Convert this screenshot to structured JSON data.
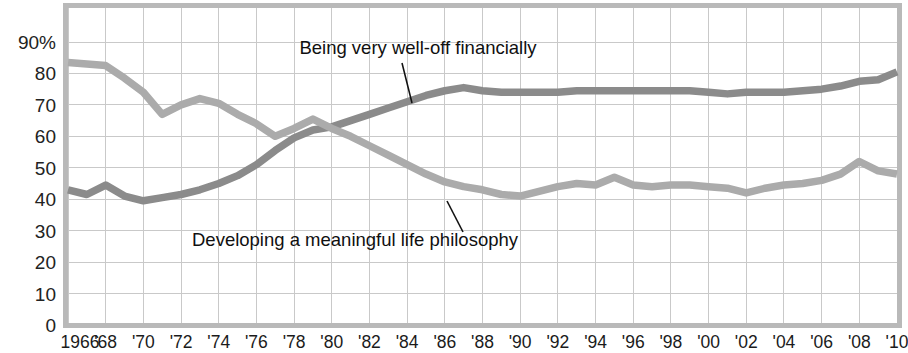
{
  "chart_data": {
    "type": "line",
    "title": "",
    "subtitle": "",
    "xlabel": "",
    "ylabel": "",
    "xlim": [
      1966,
      2010
    ],
    "ylim": [
      0,
      95
    ],
    "grid": true,
    "legend_position": "inline-annotations",
    "x": [
      1966,
      1967,
      1968,
      1969,
      1970,
      1971,
      1972,
      1973,
      1974,
      1975,
      1976,
      1977,
      1978,
      1979,
      1980,
      1981,
      1982,
      1983,
      1984,
      1985,
      1986,
      1987,
      1988,
      1989,
      1990,
      1991,
      1992,
      1993,
      1994,
      1995,
      1996,
      1997,
      1998,
      1999,
      2000,
      2001,
      2002,
      2003,
      2004,
      2005,
      2006,
      2007,
      2008,
      2009,
      2010
    ],
    "tick_labels": [
      "1966",
      "'68",
      "'70",
      "'72",
      "'74",
      "'76",
      "'78",
      "'80",
      "'82",
      "'84",
      "'86",
      "'88",
      "'90",
      "'92",
      "'94",
      "'96",
      "'98",
      "'00",
      "'02",
      "'04",
      "'06",
      "'08",
      "'10"
    ],
    "tick_years": [
      1966,
      1968,
      1970,
      1972,
      1974,
      1976,
      1978,
      1980,
      1982,
      1984,
      1986,
      1988,
      1990,
      1992,
      1994,
      1996,
      1998,
      2000,
      2002,
      2004,
      2006,
      2008,
      2010
    ],
    "ytick_labels": [
      "90%",
      "80",
      "70",
      "60",
      "50",
      "40",
      "30",
      "20",
      "10",
      "0"
    ],
    "ytick_values": [
      90,
      80,
      70,
      60,
      50,
      40,
      30,
      20,
      10,
      0
    ],
    "series": [
      {
        "name": "Being very well-off financially",
        "color": "#8b8b8b",
        "annotation": "Being very well-off financially",
        "values": [
          43,
          41.5,
          44.5,
          41,
          39.5,
          40.5,
          41.5,
          43,
          45,
          47.5,
          51,
          55.5,
          59.5,
          62,
          63,
          65,
          67,
          69,
          71,
          73,
          74.5,
          75.5,
          74.5,
          74,
          74,
          74,
          74,
          74.5,
          74.5,
          74.5,
          74.5,
          74.5,
          74.5,
          74.5,
          74,
          73.5,
          74,
          74,
          74,
          74.5,
          75,
          76,
          77.5,
          78,
          80.5
        ]
      },
      {
        "name": "Developing a meaningful life philosophy",
        "color": "#ababab",
        "annotation": "Developing a meaningful life philosophy",
        "values": [
          83.5,
          83,
          82.5,
          78.5,
          74,
          67,
          70,
          72,
          70.5,
          67,
          64,
          60,
          62.5,
          65.5,
          62.5,
          60,
          57,
          54,
          51,
          48,
          45.5,
          44,
          43,
          41.5,
          41,
          42.5,
          44,
          45,
          44.5,
          47,
          44.5,
          44,
          44.5,
          44.5,
          44,
          43.5,
          42,
          43.5,
          44.5,
          45,
          46,
          48,
          52,
          49,
          48
        ]
      }
    ]
  },
  "axes": {
    "y_top_label": "90%",
    "y_bottom_label": "0",
    "x_first_label": "1966",
    "x_last_label": "'10"
  },
  "colors": {
    "well_off_line": "#8b8b8b",
    "philosophy_line": "#ababab",
    "grid": "#c9c9c9",
    "frame": "#b8b8b8",
    "text": "#1b1b1b",
    "background": "#ffffff"
  },
  "annotations": {
    "well_off": "Being very well-off financially",
    "philosophy": "Developing a meaningful life philosophy"
  }
}
